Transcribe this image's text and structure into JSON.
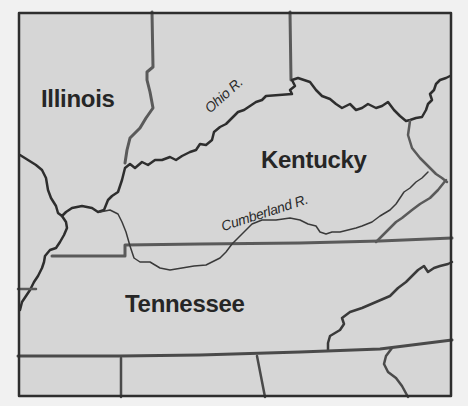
{
  "map": {
    "title": "",
    "background_color": "#f1f1f1",
    "land_color": "#d6d6d6",
    "border_color": "#3a3a3a",
    "state_border_color": "#5a5a5a",
    "river_color": "#2e2e2e",
    "states": [
      {
        "name": "Illinois",
        "label": "Illinois"
      },
      {
        "name": "Kentucky",
        "label": "Kentucky"
      },
      {
        "name": "Tennessee",
        "label": "Tennessee"
      }
    ],
    "rivers": [
      {
        "name": "Ohio River",
        "label": "Ohio R."
      },
      {
        "name": "Cumberland River",
        "label": "Cumberland R."
      }
    ]
  }
}
